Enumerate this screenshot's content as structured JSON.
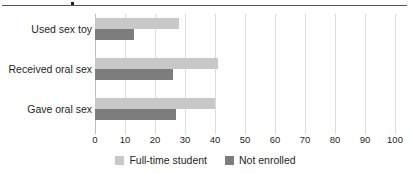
{
  "figure": {
    "top_rule": true
  },
  "legend": {
    "position": "bottom-center",
    "items": [
      {
        "label": "Full-time student",
        "color": "#c8c8c8",
        "swatch_name": "legend-swatch-full-time-student"
      },
      {
        "label": "Not enrolled",
        "color": "#7d7d7d",
        "swatch_name": "legend-swatch-not-enrolled"
      }
    ]
  },
  "chart_data": {
    "type": "bar",
    "orientation": "horizontal",
    "title": "",
    "subtitle": "",
    "xlabel": "",
    "ylabel": "",
    "xlim": [
      0,
      100
    ],
    "xticks": [
      0,
      10,
      20,
      30,
      40,
      50,
      60,
      70,
      80,
      90,
      100
    ],
    "xtick_labels": [
      "0",
      "10",
      "20",
      "30",
      "40",
      "50",
      "60",
      "70",
      "80",
      "90",
      "100"
    ],
    "grid": true,
    "grid_axis": "x",
    "legend_position": "bottom-center",
    "categories": [
      "Used sex toy",
      "Received oral sex",
      "Gave oral sex"
    ],
    "series": [
      {
        "name": "Full-time student",
        "color": "#c8c8c8",
        "values": [
          28,
          41,
          40
        ]
      },
      {
        "name": "Not enrolled",
        "color": "#7d7d7d",
        "values": [
          13,
          26,
          27
        ]
      }
    ]
  }
}
